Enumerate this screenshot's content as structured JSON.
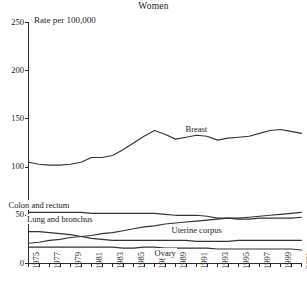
{
  "chart_data": {
    "type": "line",
    "title": "Women",
    "ylabel": "Rate per 100,000",
    "xlabel": "",
    "ylim": [
      0,
      250
    ],
    "yticks": [
      0,
      50,
      100,
      150,
      200,
      250
    ],
    "xlim": [
      1975,
      2001
    ],
    "xticks": [
      1975,
      1976,
      1977,
      1978,
      1979,
      1980,
      1981,
      1982,
      1983,
      1984,
      1985,
      1986,
      1987,
      1988,
      1989,
      1990,
      1991,
      1992,
      1993,
      1994,
      1995,
      1996,
      1997,
      1998,
      1999,
      2000,
      2001
    ],
    "xtick_labels": [
      "1975",
      "",
      "1977",
      "",
      "1979",
      "",
      "1981",
      "",
      "1983",
      "",
      "1985",
      "",
      "1987",
      "",
      "1989",
      "",
      "1991",
      "",
      "1993",
      "",
      "1995",
      "",
      "1997",
      "",
      "1999",
      "",
      "2001"
    ],
    "grid": false,
    "legend_position": "inline-annotations",
    "x": [
      1975,
      1976,
      1977,
      1978,
      1979,
      1980,
      1981,
      1982,
      1983,
      1984,
      1985,
      1986,
      1987,
      1988,
      1989,
      1990,
      1991,
      1992,
      1993,
      1994,
      1995,
      1996,
      1997,
      1998,
      1999,
      2000,
      2001
    ],
    "series": [
      {
        "name": "Breast",
        "values": [
          105,
          103,
          102,
          102,
          103,
          105,
          110,
          110,
          112,
          118,
          125,
          132,
          138,
          134,
          129,
          131,
          133,
          132,
          128,
          130,
          131,
          132,
          135,
          138,
          139,
          137,
          135
        ]
      },
      {
        "name": "Colon and rectum",
        "values": [
          53,
          53,
          53,
          53,
          53,
          53,
          52,
          52,
          52,
          52,
          52,
          52,
          52,
          51,
          50,
          50,
          50,
          49,
          47,
          47,
          46,
          46,
          47,
          47,
          47,
          47,
          48
        ]
      },
      {
        "name": "Lung and bronchus",
        "values": [
          21,
          22,
          24,
          25,
          27,
          28,
          29,
          31,
          32,
          34,
          36,
          38,
          39,
          41,
          42,
          43,
          44,
          45,
          46,
          47,
          47,
          48,
          49,
          50,
          51,
          52,
          53
        ]
      },
      {
        "name": "Uterine corpus",
        "values": [
          33,
          33,
          32,
          31,
          30,
          28,
          26,
          25,
          24,
          24,
          24,
          24,
          24,
          24,
          24,
          24,
          23,
          23,
          23,
          23,
          24,
          24,
          24,
          24,
          24,
          24,
          24
        ]
      },
      {
        "name": "Ovary",
        "values": [
          17,
          17,
          17,
          17,
          17,
          17,
          17,
          17,
          17,
          16,
          16,
          17,
          17,
          16,
          16,
          16,
          16,
          16,
          15,
          15,
          15,
          15,
          15,
          15,
          15,
          15,
          14
        ]
      }
    ],
    "annotations": [
      {
        "text": "Breast",
        "x": 1991,
        "y": 138
      },
      {
        "text": "Colon and rectum",
        "x": 1976,
        "y": 60
      },
      {
        "text": "Lung and bronchus",
        "x": 1978,
        "y": 45
      },
      {
        "text": "Uterine corpus",
        "x": 1991,
        "y": 34
      },
      {
        "text": "Ovary",
        "x": 1988,
        "y": 10
      }
    ],
    "colors": {
      "line": "#333333",
      "axis": "#2b2b2b",
      "background": "#ffffff"
    }
  },
  "footnote": {
    "text": ""
  }
}
